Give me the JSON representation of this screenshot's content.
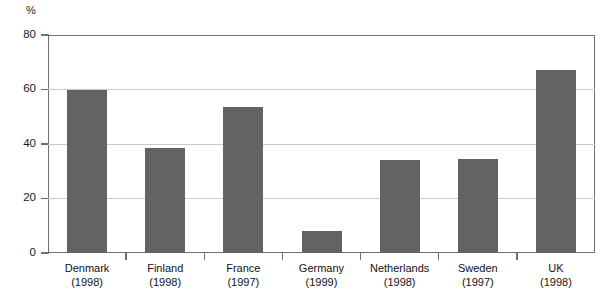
{
  "chart_data": {
    "type": "bar",
    "title": "",
    "subtitle": "",
    "xlabel": "",
    "ylabel": "%",
    "unit_label": "%",
    "ylim": [
      0,
      80
    ],
    "yticks": [
      0,
      20,
      40,
      60,
      80
    ],
    "ytick_labels": [
      "0",
      "20",
      "40",
      "60",
      "80"
    ],
    "grid": true,
    "grid_axis": "y",
    "legend": false,
    "legend_position": "none",
    "bar_color": "#636363",
    "gridline_color": "#c9c9c9",
    "axis_color": "#6f6f6f",
    "background_color": "#ffffff",
    "categories": [
      "Denmark",
      "Finland",
      "France",
      "Germany",
      "Netherlands",
      "Sweden",
      "UK"
    ],
    "category_years": [
      "(1998)",
      "(1998)",
      "(1997)",
      "(1999)",
      "(1998)",
      "(1997)",
      "(1998)"
    ],
    "values": [
      60,
      38.5,
      53.5,
      8,
      34,
      34.5,
      67
    ]
  }
}
